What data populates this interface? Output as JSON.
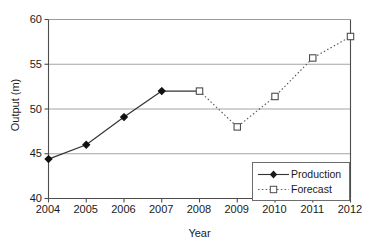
{
  "chart_data": {
    "type": "line",
    "title": "",
    "xlabel": "Year",
    "ylabel": "Output (m)",
    "x": [
      2004,
      2005,
      2006,
      2007,
      2008,
      2009,
      2010,
      2011,
      2012
    ],
    "xticklabels": [
      "2004",
      "2005",
      "2006",
      "2007",
      "2008",
      "2009",
      "2010",
      "2011",
      "2012"
    ],
    "yticklabels": [
      "40",
      "45",
      "50",
      "55",
      "60"
    ],
    "yticks": [
      40,
      45,
      50,
      55,
      60
    ],
    "ylim": [
      40,
      60
    ],
    "xlim": [
      2004,
      2012
    ],
    "grid": "horizontal",
    "legend_position": "lower right",
    "series": [
      {
        "name": "Production",
        "linestyle": "solid",
        "marker": "filled-diamond",
        "color": "#333333",
        "x": [
          2004,
          2005,
          2006,
          2007
        ],
        "values": [
          44.4,
          46.0,
          49.1,
          52.0
        ]
      },
      {
        "name": "Forecast",
        "linestyle": "dotted",
        "marker": "open-square",
        "color": "#555555",
        "x": [
          2008,
          2009,
          2010,
          2011,
          2012
        ],
        "values": [
          52.0,
          48.0,
          51.4,
          55.7,
          58.1
        ]
      }
    ],
    "connector": {
      "note": "solid segment joins Production 2007 to Forecast 2008",
      "from": [
        2007,
        52.0
      ],
      "to": [
        2008,
        52.0
      ]
    }
  },
  "legend": {
    "items": [
      {
        "label": "Production"
      },
      {
        "label": "Forecast"
      }
    ]
  },
  "axes": {
    "x_title": "Year",
    "y_title": "Output (m)"
  },
  "colors": {
    "axis": "#4d4d4d",
    "grid": "#9a9a9a",
    "production_line": "#333333",
    "forecast_line": "#666666",
    "background": "#ffffff",
    "text": "#1a1a1a"
  }
}
